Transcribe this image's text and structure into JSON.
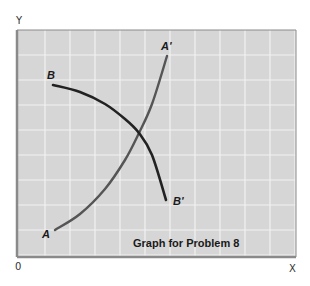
{
  "chart_data": {
    "type": "line",
    "title": "Graph for Problem 8",
    "xlabel": "X",
    "ylabel": "Y",
    "origin_label": "0",
    "grid": true,
    "axis_ticks": "none (unlabeled grid)",
    "plot_area_px": {
      "left": 17,
      "top": 30,
      "right": 296,
      "bottom": 257
    },
    "series": [
      {
        "name": "AA'",
        "start_label": "A",
        "end_label": "A'",
        "shape": "upward-sloping, convex",
        "color": "#555555",
        "points_px": [
          [
            55,
            230
          ],
          [
            80,
            214
          ],
          [
            105,
            189
          ],
          [
            125,
            160
          ],
          [
            139,
            133
          ],
          [
            152,
            104
          ],
          [
            167,
            56
          ]
        ]
      },
      {
        "name": "BB'",
        "start_label": "B",
        "end_label": "B'",
        "shape": "downward-sloping, concave",
        "color": "#222222",
        "points_px": [
          [
            53,
            85
          ],
          [
            80,
            92
          ],
          [
            105,
            104
          ],
          [
            125,
            119
          ],
          [
            139,
            133
          ],
          [
            152,
            155
          ],
          [
            166,
            200
          ]
        ]
      }
    ],
    "intersection_px": [
      139,
      133
    ]
  },
  "colors": {
    "plot_background": "#d6d6d6",
    "grid_line": "#f2f2f2",
    "frame": "#8a8a8a",
    "curve_a": "#555555",
    "curve_b": "#222222",
    "text": "#1a1a1a"
  }
}
